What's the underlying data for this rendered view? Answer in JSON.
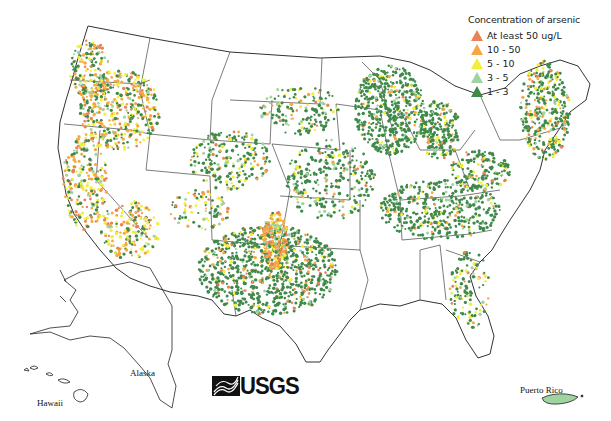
{
  "legend": {
    "title": "Concentration of arsenic",
    "items": [
      {
        "label": "At least 50 ug/L",
        "color": "#e8825a",
        "icon": "triangle-icon"
      },
      {
        "label": "10 - 50",
        "color": "#f5a742",
        "icon": "triangle-icon"
      },
      {
        "label": "5 - 10",
        "color": "#f2ee3a",
        "icon": "triangle-icon"
      },
      {
        "label": "3 - 5",
        "color": "#9fd3a0",
        "icon": "triangle-icon"
      },
      {
        "label": "1 - 3",
        "color": "#3f8a4a",
        "icon": "triangle-icon"
      }
    ]
  },
  "labels": {
    "alaska": "Alaska",
    "hawaii": "Hawaii",
    "puerto_rico": "Puerto Rico"
  },
  "logo": {
    "text": "USGS"
  },
  "colors": {
    "outline": "#333333",
    "background": "#ffffff"
  }
}
